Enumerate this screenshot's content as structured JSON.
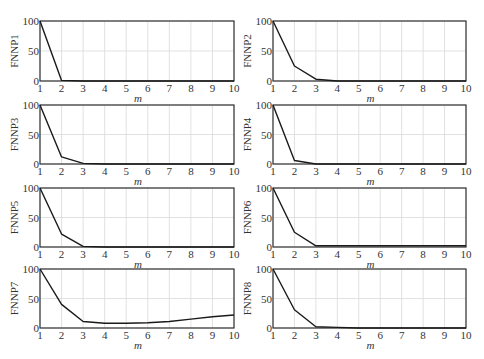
{
  "chart_data": [
    {
      "type": "line",
      "ylabel": "FNNP1",
      "xlabel": "m",
      "x": [
        1,
        2,
        3,
        4,
        5,
        6,
        7,
        8,
        9,
        10
      ],
      "values": [
        100,
        1,
        0,
        0,
        0,
        0,
        0,
        0,
        0,
        0
      ],
      "xlim": [
        1,
        10
      ],
      "ylim": [
        0,
        100
      ],
      "xticks": [
        "1",
        "2",
        "3",
        "4",
        "5",
        "6",
        "7",
        "8",
        "9",
        "10"
      ],
      "yticks": [
        "0",
        "50",
        "100"
      ],
      "grid": true
    },
    {
      "type": "line",
      "ylabel": "FNNP2",
      "xlabel": "m",
      "x": [
        1,
        2,
        3,
        4,
        5,
        6,
        7,
        8,
        9,
        10
      ],
      "values": [
        100,
        25,
        3,
        0,
        0,
        0,
        0,
        0,
        0,
        0
      ],
      "xlim": [
        1,
        10
      ],
      "ylim": [
        0,
        100
      ],
      "xticks": [
        "1",
        "2",
        "3",
        "4",
        "5",
        "6",
        "7",
        "8",
        "9",
        "10"
      ],
      "yticks": [
        "0",
        "50",
        "100"
      ],
      "grid": true
    },
    {
      "type": "line",
      "ylabel": "FNNP3",
      "xlabel": "m",
      "x": [
        1,
        2,
        3,
        4,
        5,
        6,
        7,
        8,
        9,
        10
      ],
      "values": [
        100,
        12,
        1,
        0,
        0,
        0,
        0,
        0,
        0,
        0
      ],
      "xlim": [
        1,
        10
      ],
      "ylim": [
        0,
        100
      ],
      "xticks": [
        "1",
        "2",
        "3",
        "4",
        "5",
        "6",
        "7",
        "8",
        "9",
        "10"
      ],
      "yticks": [
        "0",
        "50",
        "100"
      ],
      "grid": true
    },
    {
      "type": "line",
      "ylabel": "FNNP4",
      "xlabel": "m",
      "x": [
        1,
        2,
        3,
        4,
        5,
        6,
        7,
        8,
        9,
        10
      ],
      "values": [
        100,
        6,
        0,
        0,
        0,
        0,
        0,
        0,
        0,
        0
      ],
      "xlim": [
        1,
        10
      ],
      "ylim": [
        0,
        100
      ],
      "xticks": [
        "1",
        "2",
        "3",
        "4",
        "5",
        "6",
        "7",
        "8",
        "9",
        "10"
      ],
      "yticks": [
        "0",
        "50",
        "100"
      ],
      "grid": true
    },
    {
      "type": "line",
      "ylabel": "FNNP5",
      "xlabel": "m",
      "x": [
        1,
        2,
        3,
        4,
        5,
        6,
        7,
        8,
        9,
        10
      ],
      "values": [
        100,
        22,
        1,
        0,
        0,
        0,
        0,
        0,
        0,
        0
      ],
      "xlim": [
        1,
        10
      ],
      "ylim": [
        0,
        100
      ],
      "xticks": [
        "1",
        "2",
        "3",
        "4",
        "5",
        "6",
        "7",
        "8",
        "9",
        "10"
      ],
      "yticks": [
        "0",
        "50",
        "100"
      ],
      "grid": true
    },
    {
      "type": "line",
      "ylabel": "FNNP6",
      "xlabel": "m",
      "x": [
        1,
        2,
        3,
        4,
        5,
        6,
        7,
        8,
        9,
        10
      ],
      "values": [
        100,
        25,
        2,
        2,
        2,
        2,
        2,
        2,
        2,
        2
      ],
      "xlim": [
        1,
        10
      ],
      "ylim": [
        0,
        100
      ],
      "xticks": [
        "1",
        "2",
        "3",
        "4",
        "5",
        "6",
        "7",
        "8",
        "9",
        "10"
      ],
      "yticks": [
        "0",
        "50",
        "100"
      ],
      "grid": true
    },
    {
      "type": "line",
      "ylabel": "FNNP7",
      "xlabel": "m",
      "x": [
        1,
        2,
        3,
        4,
        5,
        6,
        7,
        8,
        9,
        10
      ],
      "values": [
        100,
        40,
        11,
        8,
        8,
        9,
        11,
        15,
        19,
        22
      ],
      "xlim": [
        1,
        10
      ],
      "ylim": [
        0,
        100
      ],
      "xticks": [
        "1",
        "2",
        "3",
        "4",
        "5",
        "6",
        "7",
        "8",
        "9",
        "10"
      ],
      "yticks": [
        "0",
        "50",
        "100"
      ],
      "grid": true
    },
    {
      "type": "line",
      "ylabel": "FNNP8",
      "xlabel": "m",
      "x": [
        1,
        2,
        3,
        4,
        5,
        6,
        7,
        8,
        9,
        10
      ],
      "values": [
        100,
        31,
        2,
        1,
        0,
        0,
        0,
        0,
        0,
        0
      ],
      "xlim": [
        1,
        10
      ],
      "ylim": [
        0,
        100
      ],
      "xticks": [
        "1",
        "2",
        "3",
        "4",
        "5",
        "6",
        "7",
        "8",
        "9",
        "10"
      ],
      "yticks": [
        "0",
        "50",
        "100"
      ],
      "grid": true
    }
  ],
  "style": {
    "line_color": "#1a1a1a",
    "axis_color": "#333333",
    "grid_color": "#d9d9d9"
  }
}
